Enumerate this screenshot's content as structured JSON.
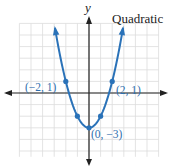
{
  "chart_data": {
    "type": "line",
    "title": "Quadratic",
    "xlabel": "",
    "ylabel": "y",
    "function": "y = x^2 - 3",
    "xlim": [
      -6,
      6
    ],
    "ylim": [
      -5.5,
      6
    ],
    "grid": true,
    "series": [
      {
        "name": "Quadratic",
        "color": "#2a72b8",
        "points": [
          {
            "x": -2,
            "y": 1,
            "label": "(−2, 1)"
          },
          {
            "x": -1,
            "y": -2
          },
          {
            "x": 0,
            "y": -3,
            "label": "(0, −3)"
          },
          {
            "x": 1,
            "y": -2
          },
          {
            "x": 2,
            "y": 1,
            "label": "(2, 1)"
          }
        ]
      }
    ],
    "annotations": [
      "(−2, 1)",
      "(2, 1)",
      "(0, −3)"
    ]
  },
  "labels": {
    "title": "Quadratic",
    "y_axis": "y",
    "point_left": "(−2, 1)",
    "point_right": "(2, 1)",
    "point_vertex": "(0, −3)"
  },
  "colors": {
    "curve": "#2a72b8",
    "label": "#2f6fae",
    "grid": "#d9d9d9",
    "axis": "#222222"
  }
}
